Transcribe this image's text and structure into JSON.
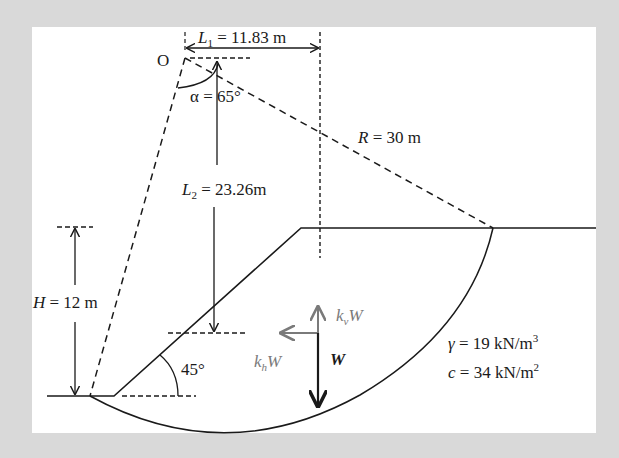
{
  "figure": {
    "type": "slope-stability-diagram",
    "labels": {
      "L1": {
        "symbol": "L",
        "sub": "1",
        "value": " = 11.83 m"
      },
      "origin": "O",
      "alpha": "α = 65°",
      "R": {
        "symbol": "R",
        "value": " = 30 m"
      },
      "L2": {
        "symbol": "L",
        "sub": "2",
        "value": " = 23.26m"
      },
      "H": {
        "symbol": "H",
        "value": " = 12 m"
      },
      "slope_angle": "45°",
      "kvW": {
        "k": "k",
        "sub": "v",
        "W": "W"
      },
      "khW": {
        "k": "k",
        "sub": "h",
        "W": "W"
      },
      "W": "W",
      "gamma": {
        "symbol": "γ",
        "value": " = 19 kN/m",
        "sup": "3"
      },
      "cohesion": {
        "symbol": "c",
        "value": " = 34 kN/m",
        "sup": "2"
      }
    },
    "colors": {
      "background": "#d9d9d9",
      "panel": "#ffffff",
      "line": "#1a1a1a",
      "seismic_force": "#7a7a7a"
    }
  }
}
